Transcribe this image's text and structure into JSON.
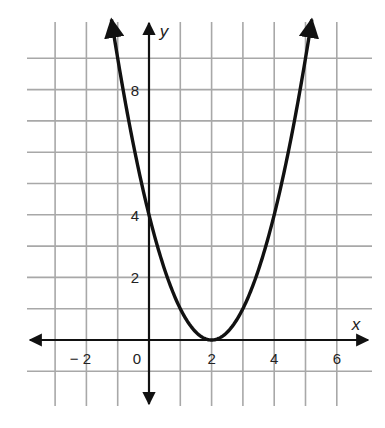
{
  "chart_data": {
    "type": "line",
    "title": "",
    "function": "y = (x - 2)^2",
    "xlabel": "x",
    "ylabel": "y",
    "xlim": [
      -4,
      7
    ],
    "ylim": [
      -1,
      10
    ],
    "grid": true,
    "x_tick_labels": [
      "− 2",
      "0",
      "2",
      "4",
      "6"
    ],
    "x_tick_values": [
      -2,
      0,
      2,
      4,
      6
    ],
    "y_tick_labels": [
      "2",
      "4",
      "8"
    ],
    "y_tick_values": [
      2,
      4,
      8
    ],
    "series": [
      {
        "name": "parabola",
        "x": [
          -1.2,
          -1,
          0,
          1,
          2,
          3,
          4,
          5,
          5.2
        ],
        "y": [
          10.24,
          9,
          4,
          1,
          0,
          1,
          4,
          9,
          10.24
        ]
      }
    ],
    "key_points": {
      "vertex": [
        2,
        0
      ],
      "y_intercept": [
        0,
        4
      ]
    },
    "colors": {
      "grid": "#a8a8a8",
      "axes": "#111111",
      "curve": "#111111"
    }
  }
}
